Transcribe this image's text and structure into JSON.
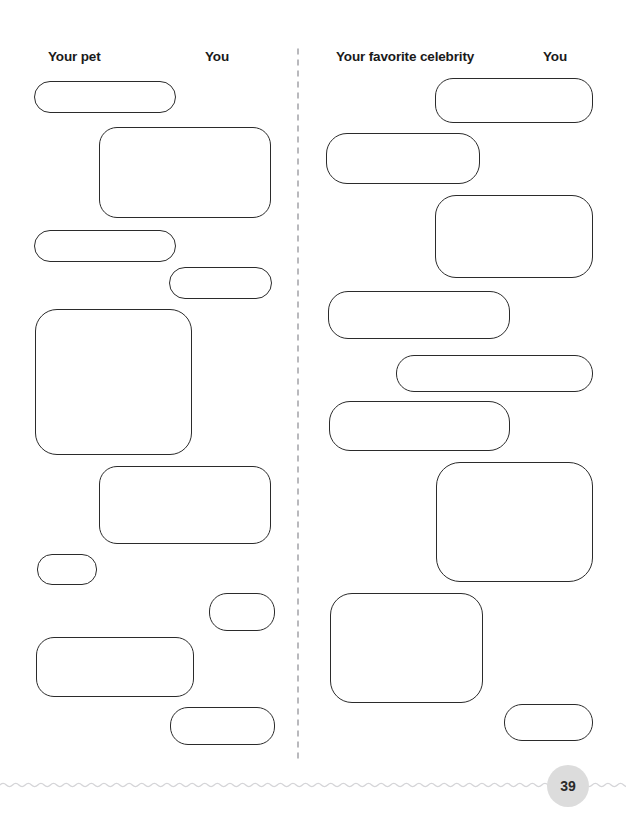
{
  "page": {
    "number": "39",
    "background_color": "#ffffff",
    "bubble_outline_color": "#2b2b2b",
    "divider_dot_color": "#b9b9bd",
    "wave_color": "#d5d5d8",
    "badge_background_color": "#dcdcdc"
  },
  "columns": [
    {
      "id": "left",
      "headers": [
        {
          "label": "Your pet",
          "x": 48,
          "y": 50
        },
        {
          "label": "You",
          "x": 205,
          "y": 50
        }
      ],
      "bubbles": [
        {
          "side": "left",
          "x": 34,
          "y": 81,
          "w": 142,
          "h": 32,
          "r": 16
        },
        {
          "side": "right",
          "x": 99,
          "y": 127,
          "w": 172,
          "h": 91,
          "r": 18
        },
        {
          "side": "left",
          "x": 34,
          "y": 230,
          "w": 142,
          "h": 32,
          "r": 16
        },
        {
          "side": "right",
          "x": 169,
          "y": 267,
          "w": 103,
          "h": 32,
          "r": 16
        },
        {
          "side": "left",
          "x": 35,
          "y": 309,
          "w": 157,
          "h": 146,
          "r": 22
        },
        {
          "side": "right",
          "x": 99,
          "y": 466,
          "w": 172,
          "h": 78,
          "r": 18
        },
        {
          "side": "left",
          "x": 37,
          "y": 554,
          "w": 60,
          "h": 31,
          "r": 15
        },
        {
          "side": "right",
          "x": 209,
          "y": 593,
          "w": 66,
          "h": 38,
          "r": 18
        },
        {
          "side": "left",
          "x": 36,
          "y": 637,
          "w": 158,
          "h": 60,
          "r": 18
        },
        {
          "side": "right",
          "x": 170,
          "y": 707,
          "w": 105,
          "h": 38,
          "r": 18
        }
      ]
    },
    {
      "id": "right",
      "headers": [
        {
          "label": "Your favorite celebrity",
          "x": 336,
          "y": 50
        },
        {
          "label": "You",
          "x": 543,
          "y": 50
        }
      ],
      "bubbles": [
        {
          "side": "right",
          "x": 435,
          "y": 78,
          "w": 158,
          "h": 45,
          "r": 18
        },
        {
          "side": "left",
          "x": 326,
          "y": 133,
          "w": 154,
          "h": 51,
          "r": 21
        },
        {
          "side": "right",
          "x": 435,
          "y": 195,
          "w": 158,
          "h": 83,
          "r": 21
        },
        {
          "side": "left",
          "x": 328,
          "y": 291,
          "w": 182,
          "h": 48,
          "r": 20
        },
        {
          "side": "right",
          "x": 396,
          "y": 355,
          "w": 197,
          "h": 37,
          "r": 18
        },
        {
          "side": "left",
          "x": 329,
          "y": 401,
          "w": 181,
          "h": 50,
          "r": 21
        },
        {
          "side": "right",
          "x": 436,
          "y": 462,
          "w": 157,
          "h": 120,
          "r": 24
        },
        {
          "side": "left",
          "x": 330,
          "y": 593,
          "w": 153,
          "h": 110,
          "r": 22
        },
        {
          "side": "right",
          "x": 504,
          "y": 704,
          "w": 89,
          "h": 37,
          "r": 18
        }
      ]
    }
  ]
}
